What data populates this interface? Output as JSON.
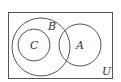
{
  "diagram": {
    "type": "venn",
    "universe": {
      "label": "U",
      "x": 8,
      "y": 12,
      "w": 104,
      "h": 66
    },
    "sets": [
      {
        "id": "B",
        "label": "B",
        "cx": 41,
        "cy": 47,
        "r": 29,
        "label_x": 50,
        "label_y": 30
      },
      {
        "id": "C",
        "label": "C",
        "cx": 34,
        "cy": 45,
        "r": 16,
        "label_x": 34,
        "label_y": 49
      },
      {
        "id": "A",
        "label": "A",
        "cx": 80,
        "cy": 45,
        "r": 21,
        "label_x": 79,
        "label_y": 49
      }
    ],
    "relations": [
      "C subset of B",
      "A intersects B",
      "A and C disjoint"
    ],
    "colors": {
      "stroke": "#555555",
      "background": "#ffffff"
    }
  }
}
